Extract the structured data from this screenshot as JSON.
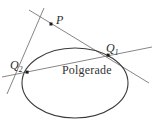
{
  "figure": {
    "title": "Polgerade",
    "background_color": "#ffffff",
    "stroke_color": "#555555",
    "conic_stroke_color": "#3a3a3a",
    "text_color": "#2b2b2b",
    "labels": {
      "pole": "P",
      "tangent_point_1_base": "Q",
      "tangent_point_1_sub": "1",
      "tangent_point_2_base": "Q",
      "tangent_point_2_sub": "2",
      "polar_line": "Polgerade"
    },
    "geometry": {
      "ellipse": {
        "cx": 75,
        "cy": 83,
        "rx": 53,
        "ry": 35
      },
      "pole_point": {
        "x": 51,
        "y": 24
      },
      "tangent_point_1": {
        "x": 108,
        "y": 55
      },
      "tangent_point_2": {
        "x": 27,
        "y": 72
      },
      "tangent_line_1": {
        "x1": 29,
        "y1": 10,
        "x2": 149,
        "y2": 83
      },
      "tangent_line_2": {
        "x1": 44,
        "y1": 8,
        "x2": 7,
        "y2": 94
      },
      "polar_line": {
        "x1": 2,
        "y1": 77,
        "x2": 152,
        "y2": 47
      }
    }
  }
}
